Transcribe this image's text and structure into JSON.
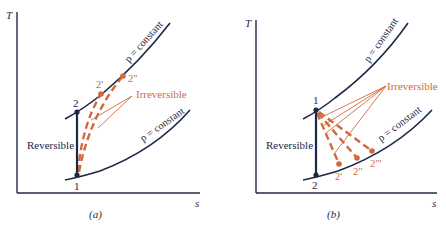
{
  "colors": {
    "axis": "#1f2a4a",
    "curve": "#1c2847",
    "reversible": "#1c2847",
    "irreversible": "#d06a3c",
    "point": "#1c2847",
    "text_dark": "#2a2a3a"
  },
  "panel_a": {
    "caption": "(a)",
    "y_axis_label": "T",
    "x_axis_label": "s",
    "upper_isobar_label": "p = constant",
    "lower_isobar_label": "p = constant",
    "reversible_label": "Reversible",
    "irreversible_label": "Irreversible",
    "state_1": "1",
    "state_2": "2",
    "state_2p": "2'",
    "state_2pp": "2\""
  },
  "panel_b": {
    "caption": "(b)",
    "y_axis_label": "T",
    "x_axis_label": "s",
    "upper_isobar_label": "p = constant",
    "lower_isobar_label": "p = constant",
    "reversible_label": "Reversible",
    "irreversible_label": "Irreversible",
    "state_1": "1",
    "state_2": "2",
    "state_2p": "2'",
    "state_2pp": "2\"",
    "state_2ppp": "2\"'"
  }
}
